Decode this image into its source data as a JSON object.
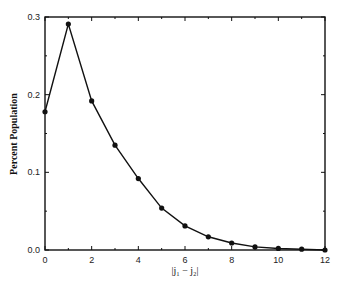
{
  "chart_data": {
    "type": "line",
    "title": "",
    "xlabel": "|j₁ − j₂|",
    "ylabel": "Percent Population",
    "x": [
      0,
      1,
      2,
      3,
      4,
      5,
      6,
      7,
      8,
      9,
      10,
      11,
      12
    ],
    "series": [
      {
        "name": "Percent Population",
        "values": [
          0.178,
          0.291,
          0.192,
          0.135,
          0.092,
          0.054,
          0.031,
          0.017,
          0.009,
          0.004,
          0.002,
          0.001,
          0.0
        ],
        "color": "#111111",
        "marker": "circle"
      }
    ],
    "xlim": [
      0,
      12
    ],
    "ylim": [
      0.0,
      0.3
    ],
    "xticks": [
      0,
      2,
      4,
      6,
      8,
      10,
      12
    ],
    "xticks_minor": [
      1,
      3,
      5,
      7,
      9,
      11
    ],
    "yticks": [
      "0.0",
      "0.1",
      "0.2",
      "0.3"
    ],
    "yticks_minor": [
      0.05,
      0.15,
      0.25
    ],
    "grid": false,
    "legend": null
  }
}
